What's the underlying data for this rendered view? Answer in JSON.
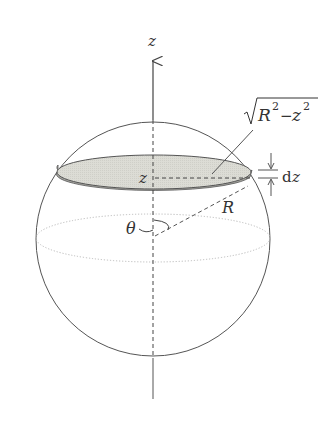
{
  "figure": {
    "type": "sphere-slice-diagram",
    "labels": {
      "axis": "z",
      "slice_height": "z",
      "slice_radius_sqrt": "√",
      "slice_radius_R": "R",
      "slice_radius_R_exp": "2",
      "slice_radius_minus": "−",
      "slice_radius_z": "z",
      "slice_radius_z_exp": "2",
      "thickness": "dz",
      "thickness_d": "d",
      "thickness_z": "z",
      "radius": "R",
      "angle": "θ"
    },
    "colors": {
      "outline": "#555555",
      "slice_top": "#d9d9d2",
      "slice_rim": "#a8a8a2",
      "equator": "#bbbbbb",
      "text": "#333333"
    }
  }
}
